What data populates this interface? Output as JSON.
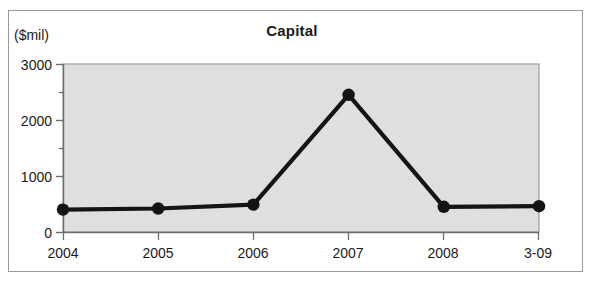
{
  "figure": {
    "background_color": "#ffffff",
    "frame_border_color": "#9a9a9a"
  },
  "title": "Capital",
  "y_axis_unit_label": "($mil)",
  "chart_data": {
    "type": "line",
    "title": "Capital",
    "xlabel": "",
    "ylabel": "($mil)",
    "categories": [
      "2004",
      "2005",
      "2006",
      "2007",
      "2008",
      "3-09"
    ],
    "values": [
      400,
      420,
      490,
      2450,
      450,
      460
    ],
    "series": [
      {
        "name": "Capital",
        "values": [
          400,
          420,
          490,
          2450,
          450,
          460
        ]
      }
    ],
    "ylim": [
      0,
      3000
    ],
    "y_major_ticks": [
      0,
      1000,
      2000,
      3000
    ],
    "y_minor_ticks": [
      500,
      1500,
      2500
    ],
    "y_tick_labels": [
      "0",
      "1000",
      "2000",
      "3000"
    ],
    "x_tick_labels": [
      "2004",
      "2005",
      "2006",
      "2007",
      "2008",
      "3-09"
    ],
    "grid": false,
    "legend": false,
    "legend_position": "none",
    "line_color": "#141414",
    "marker_color": "#141414",
    "marker_shape": "circle",
    "plot_background_color": "#e0e0e0"
  }
}
